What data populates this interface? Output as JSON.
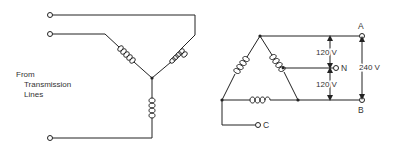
{
  "left_diagram": {
    "type": "wye",
    "caption_lines": [
      "From",
      "Transmission",
      "Lines"
    ]
  },
  "right_diagram": {
    "type": "delta",
    "terminals": {
      "a": "A",
      "n": "N",
      "b": "B",
      "c": "C"
    },
    "voltages": {
      "upper": "120 V",
      "lower": "120 V",
      "total": "240 V"
    }
  },
  "colors": {
    "line": "#222222",
    "text": "#333333",
    "background": "#ffffff"
  }
}
